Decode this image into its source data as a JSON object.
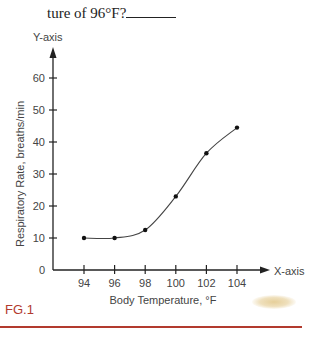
{
  "question": {
    "text": "ture of 96°F?"
  },
  "figure": {
    "label": "FG.1",
    "accent_color": "#b23a2e"
  },
  "chart_data": {
    "type": "line",
    "title": "",
    "xlabel": "Body Temperature, °F",
    "ylabel": "Respiratory Rate, breaths/min",
    "x_axis_name": "X-axis",
    "y_axis_name": "Y-axis",
    "x": [
      94,
      96,
      98,
      100,
      102,
      104
    ],
    "series": [
      {
        "name": "Respiratory Rate",
        "values": [
          10,
          10,
          12.5,
          23,
          36.5,
          44.5
        ]
      }
    ],
    "x_ticks": [
      "94",
      "96",
      "98",
      "100",
      "102",
      "104"
    ],
    "y_ticks": [
      "0",
      "10",
      "20",
      "30",
      "40",
      "50",
      "60"
    ],
    "ylim": [
      0,
      60
    ],
    "grid": false,
    "legend": "none",
    "smooth": true
  }
}
